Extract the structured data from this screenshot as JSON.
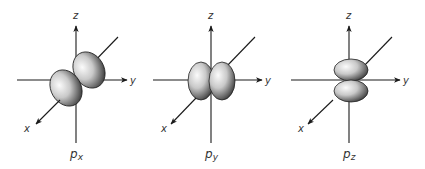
{
  "figure": {
    "panels": [
      {
        "id": "px",
        "title_main": "p",
        "title_sub": "x",
        "axis_labels": {
          "x": "x",
          "y": "y",
          "z": "z"
        },
        "orientation": "lobes along x-axis"
      },
      {
        "id": "py",
        "title_main": "p",
        "title_sub": "y",
        "axis_labels": {
          "x": "x",
          "y": "y",
          "z": "z"
        },
        "orientation": "lobes along y-axis"
      },
      {
        "id": "pz",
        "title_main": "p",
        "title_sub": "z",
        "axis_labels": {
          "x": "x",
          "y": "y",
          "z": "z"
        },
        "orientation": "lobes along z-axis"
      }
    ],
    "colors": {
      "axis": "#1a1a1a",
      "lobe_light": "#f4f4f4",
      "lobe_mid": "#bdbdbd",
      "lobe_dark": "#4a4a4a",
      "text": "#333333"
    }
  }
}
